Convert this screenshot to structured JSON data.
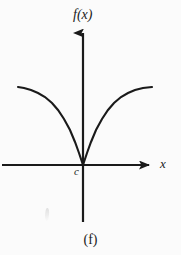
{
  "figure": {
    "caption": "(f)",
    "background_color": "#fbfbfb",
    "ink_color": "#1a1a1a"
  },
  "labels": {
    "y_axis": "f(x)",
    "x_axis": "x",
    "cusp_point": "c"
  },
  "chart_data": {
    "type": "line",
    "title": "",
    "subtitle": "",
    "xlabel": "x",
    "ylabel": "f(x)",
    "grid": false,
    "legend": null,
    "annotations": [
      {
        "text": "c",
        "x": 0,
        "y": 0,
        "note": "cusp location on x-axis"
      },
      {
        "text": "(f)",
        "note": "figure part caption"
      }
    ],
    "axes": {
      "x_axis_pixel_y": 165,
      "y_axis_pixel_x": 83,
      "x_axis_start_px": 2,
      "x_axis_end_px": 152,
      "y_axis_top_px": 30,
      "y_axis_bottom_px": 222,
      "x_arrow": "right",
      "y_arrow": "up"
    },
    "series": [
      {
        "name": "left-branch",
        "points_px": [
          [
            18,
            87
          ],
          [
            24,
            88
          ],
          [
            31,
            90
          ],
          [
            38,
            93
          ],
          [
            45,
            97
          ],
          [
            52,
            103
          ],
          [
            58,
            110
          ],
          [
            64,
            119
          ],
          [
            70,
            130
          ],
          [
            75,
            142
          ],
          [
            79,
            153
          ],
          [
            82,
            162
          ],
          [
            83,
            165
          ]
        ]
      },
      {
        "name": "right-branch",
        "points_px": [
          [
            83,
            165
          ],
          [
            84,
            162
          ],
          [
            87,
            153
          ],
          [
            91,
            142
          ],
          [
            96,
            130
          ],
          [
            102,
            119
          ],
          [
            108,
            110
          ],
          [
            114,
            103
          ],
          [
            121,
            97
          ],
          [
            128,
            93
          ],
          [
            135,
            90
          ],
          [
            143,
            88
          ],
          [
            152,
            87
          ]
        ]
      }
    ],
    "xlim": [
      -81,
      69
    ],
    "ylim": [
      -57,
      135
    ]
  }
}
